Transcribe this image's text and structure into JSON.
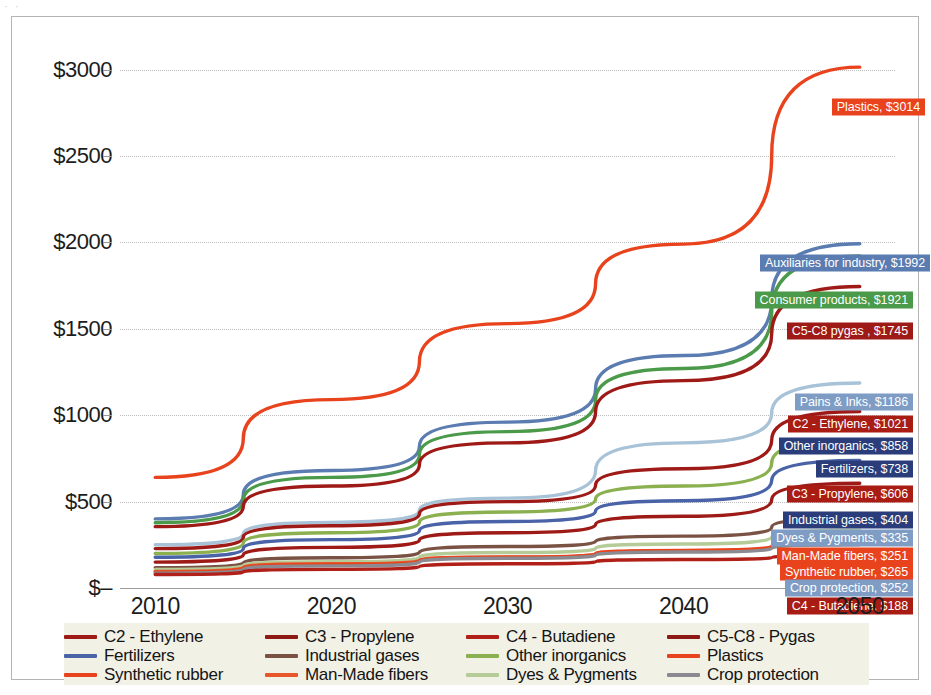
{
  "scan_artifact": "· ·",
  "chart_data": {
    "type": "line",
    "title": "",
    "subtitle": "",
    "xlabel": "",
    "ylabel": "",
    "x": [
      2010,
      2020,
      2030,
      2040,
      2050
    ],
    "xlim": [
      2008,
      2052
    ],
    "ylim": [
      0,
      3200
    ],
    "grid": true,
    "legend_position": "bottom",
    "y_ticks": [
      {
        "value": 0,
        "label": "$–"
      },
      {
        "value": 500,
        "label": "$500"
      },
      {
        "value": 1000,
        "label": "$1000"
      },
      {
        "value": 1500,
        "label": "$1500"
      },
      {
        "value": 2000,
        "label": "$2000"
      },
      {
        "value": 2500,
        "label": "$2500"
      },
      {
        "value": 3000,
        "label": "$3000"
      }
    ],
    "x_ticks": [
      "2010",
      "2020",
      "2030",
      "2040",
      "2050"
    ],
    "series": [
      {
        "name": "Plastics",
        "color": "#e8431c",
        "values": [
          640,
          1090,
          1530,
          1990,
          3014
        ]
      },
      {
        "name": "Auxiliaries for industry",
        "color": "#5b7cb0",
        "values": [
          400,
          680,
          960,
          1345,
          1992
        ]
      },
      {
        "name": "Consumer products",
        "color": "#4a9a4a",
        "values": [
          378,
          640,
          905,
          1270,
          1921
        ]
      },
      {
        "name": "C5-C8 - Pygas",
        "color": "#9e1a17",
        "values": [
          355,
          590,
          840,
          1200,
          1745
        ]
      },
      {
        "name": "Pains & Inks",
        "color": "#a8c3d8",
        "values": [
          250,
          380,
          520,
          840,
          1186
        ]
      },
      {
        "name": "C2 - Ethylene",
        "color": "#9e1a17",
        "values": [
          228,
          360,
          500,
          690,
          1021
        ]
      },
      {
        "name": "Other inorganics",
        "color": "#8ab04f",
        "values": [
          200,
          320,
          440,
          590,
          858
        ]
      },
      {
        "name": "Fertilizers",
        "color": "#4a63a8",
        "values": [
          178,
          280,
          385,
          505,
          738
        ]
      },
      {
        "name": "C3 - Propylene",
        "color": "#9e1a17",
        "values": [
          150,
          235,
          320,
          415,
          606
        ]
      },
      {
        "name": "Industrial gases",
        "color": "#7a5244",
        "values": [
          118,
          175,
          240,
          300,
          404
        ]
      },
      {
        "name": "Dyes & Pygments",
        "color": "#b5cc99",
        "values": [
          108,
          152,
          205,
          255,
          335
        ]
      },
      {
        "name": "Man-Made fibers",
        "color": "#e8562c",
        "values": [
          96,
          140,
          180,
          215,
          251
        ]
      },
      {
        "name": "Synthetic rubber",
        "color": "#e8431c",
        "values": [
          92,
          135,
          178,
          218,
          265
        ]
      },
      {
        "name": "Crop protection",
        "color": "#8a8a90",
        "values": [
          86,
          128,
          172,
          208,
          252
        ]
      },
      {
        "name": "C4 - Butadiene",
        "color": "#b02018",
        "values": [
          78,
          108,
          140,
          165,
          188
        ]
      }
    ],
    "data_labels": [
      {
        "text": "Plastics, $3014",
        "value": 3014,
        "bg": "#e8431c",
        "fg": "#ffffff",
        "y_px": 72,
        "right_px": -30
      },
      {
        "text": "Auxiliaries for industry, $1992",
        "value": 1992,
        "bg": "#5b7cb0",
        "fg": "#ffffff",
        "y_px": 228,
        "right_px": -35
      },
      {
        "text": "Consumer products, $1921",
        "value": 1921,
        "bg": "#4a9a4a",
        "fg": "#ffffff",
        "y_px": 265,
        "right_px": -18
      },
      {
        "text": "C5-C8 pygas , $1745",
        "value": 1745,
        "bg": "#9e1a17",
        "fg": "#ffffff",
        "y_px": 296,
        "right_px": -18
      },
      {
        "text": "Pains & Inks, $1186",
        "value": 1186,
        "bg": "#7e9cc4",
        "fg": "#ffffff",
        "y_px": 367,
        "right_px": -18
      },
      {
        "text": "C2 - Ethylene, $1021",
        "value": 1021,
        "bg": "#a81c14",
        "fg": "#ffffff",
        "y_px": 389,
        "right_px": -18
      },
      {
        "text": "Other inorganics, $858",
        "value": 858,
        "bg": "#2a3d7a",
        "fg": "#ffffff",
        "y_px": 411,
        "right_px": -18
      },
      {
        "text": "Fertilizers, $738",
        "value": 738,
        "bg": "#2a3d7a",
        "fg": "#ffffff",
        "y_px": 434,
        "right_px": -18
      },
      {
        "text": "C3 - Propylene, $606",
        "value": 606,
        "bg": "#a81c14",
        "fg": "#ffffff",
        "y_px": 459,
        "right_px": -18
      },
      {
        "text": "Industrial gases, $404",
        "value": 404,
        "bg": "#2a3d7a",
        "fg": "#ffffff",
        "y_px": 485,
        "right_px": -18
      },
      {
        "text": "Dyes & Pygments, $335",
        "value": 335,
        "bg": "#7e9cc4",
        "fg": "#ffffff",
        "y_px": 503,
        "right_px": -18
      },
      {
        "text": "Man-Made fibers, $251",
        "value": 251,
        "bg": "#e8431c",
        "fg": "#ffffff",
        "y_px": 521,
        "right_px": -18
      },
      {
        "text": "Synthetic rubber, $265",
        "value": 265,
        "bg": "#e8431c",
        "fg": "#ffffff",
        "y_px": 537,
        "right_px": -18
      },
      {
        "text": "Crop protection, $252",
        "value": 252,
        "bg": "#7e9cc4",
        "fg": "#ffffff",
        "y_px": 553,
        "right_px": -18
      },
      {
        "text": "C4 - Butadiene, $188",
        "value": 188,
        "bg": "#a81c14",
        "fg": "#ffffff",
        "y_px": 571,
        "right_px": -18
      }
    ],
    "legend": [
      {
        "label": "C2 - Ethylene",
        "color": "#9e1a17"
      },
      {
        "label": "C3 - Propylene",
        "color": "#8d1a15"
      },
      {
        "label": "C4 - Butadiene",
        "color": "#b02018"
      },
      {
        "label": "C5-C8 - Pygas",
        "color": "#8d1a15"
      },
      {
        "label": "Fertilizers",
        "color": "#4a63a8"
      },
      {
        "label": "Industrial gases",
        "color": "#7a5244"
      },
      {
        "label": "Other inorganics",
        "color": "#8ab04f"
      },
      {
        "label": "Plastics",
        "color": "#e8431c"
      },
      {
        "label": "Synthetic rubber",
        "color": "#e8431c"
      },
      {
        "label": "Man-Made fibers",
        "color": "#e8562c"
      },
      {
        "label": "Dyes & Pygments",
        "color": "#b5cc99"
      },
      {
        "label": "Crop protection",
        "color": "#8a8a90"
      }
    ]
  }
}
